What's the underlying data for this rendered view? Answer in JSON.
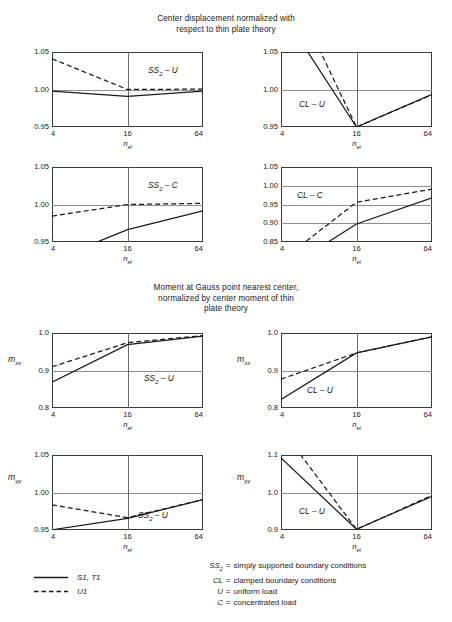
{
  "titles": {
    "displacement": "Center displacement normalized with\nrespect to thin plate theory",
    "moment": "Moment at Gauss point nearest center,\nnormalized by center moment of thin\nplate theory"
  },
  "axis": {
    "xlabel": "n",
    "xlabel_sub": "el",
    "xticks": [
      "4",
      "16",
      "64"
    ]
  },
  "legend": {
    "rows": [
      {
        "style": "solid",
        "label": "S1, T1"
      },
      {
        "style": "dashed",
        "label": "U1"
      }
    ],
    "definitions": [
      {
        "symbol": "SS",
        "symbol_sub": "2",
        "eq": "=",
        "text": "simply supported boundary conditions"
      },
      {
        "symbol": "CL",
        "symbol_sub": "",
        "eq": "=",
        "text": "clamped boundary conditions"
      },
      {
        "symbol": "U",
        "symbol_sub": "",
        "eq": "=",
        "text": "uniform load"
      },
      {
        "symbol": "C",
        "symbol_sub": "",
        "eq": "=",
        "text": "concentrated load"
      }
    ]
  },
  "chart_data": [
    {
      "id": "ss2-u-displacement",
      "type": "line",
      "title": "Center displacement normalized with respect to thin plate theory",
      "curve_label": "SS2 – U",
      "curve_label_main": "SS",
      "curve_label_sub": "2",
      "curve_label_tail": " – U",
      "xlabel": "n_el",
      "ylabel": "",
      "x": [
        4,
        16,
        64
      ],
      "xscale": "log2-categorical",
      "xticks": [
        "4",
        "16",
        "64"
      ],
      "yticks": [
        "1.05",
        "1.00",
        "0.95"
      ],
      "ytickvals": [
        1.05,
        1.0,
        0.95
      ],
      "ylim": [
        0.95,
        1.05
      ],
      "grid": true,
      "series": [
        {
          "name": "S1, T1",
          "style": "solid",
          "values": [
            0.998,
            0.991,
            0.998
          ]
        },
        {
          "name": "U1",
          "style": "dashed",
          "values": [
            1.041,
            1.0,
            1.0005
          ]
        }
      ]
    },
    {
      "id": "cl-u-displacement",
      "type": "line",
      "title": "Center displacement normalized with respect to thin plate theory",
      "curve_label": "CL – U",
      "curve_label_main": "CL",
      "curve_label_sub": "",
      "curve_label_tail": " – U",
      "xlabel": "n_el",
      "ylabel": "",
      "x": [
        4,
        16,
        64
      ],
      "xscale": "log2-categorical",
      "xticks": [
        "4",
        "16",
        "64"
      ],
      "yticks": [
        "1.05",
        "1.00",
        "0.95"
      ],
      "ytickvals": [
        1.05,
        1.0,
        0.95
      ],
      "ylim": [
        0.95,
        1.05
      ],
      "grid": true,
      "series": [
        {
          "name": "S1, T1",
          "style": "solid",
          "values": [
            1.105,
            0.95,
            0.9935
          ]
        },
        {
          "name": "U1",
          "style": "dashed",
          "values": [
            1.16,
            0.95,
            0.993
          ]
        }
      ]
    },
    {
      "id": "ss2-c-displacement",
      "type": "line",
      "title": "Center displacement normalized with respect to thin plate theory",
      "curve_label": "SS2 – C",
      "curve_label_main": "SS",
      "curve_label_sub": "2",
      "curve_label_tail": " – C",
      "xlabel": "n_el",
      "ylabel": "",
      "x": [
        4,
        16,
        64
      ],
      "xscale": "log2-categorical",
      "xticks": [
        "4",
        "16",
        "64"
      ],
      "yticks": [
        "1.05",
        "1.00",
        "0.95"
      ],
      "ytickvals": [
        1.05,
        1.0,
        0.95
      ],
      "ylim": [
        0.95,
        1.05
      ],
      "grid": true,
      "series": [
        {
          "name": "S1, T1",
          "style": "solid",
          "values": [
            0.9255,
            0.9665,
            0.9915
          ]
        },
        {
          "name": "U1",
          "style": "dashed",
          "values": [
            0.9845,
            1.0,
            1.0015
          ]
        }
      ]
    },
    {
      "id": "cl-c-displacement",
      "type": "line",
      "title": "Center displacement normalized with respect to thin plate theory",
      "curve_label": "CL – C",
      "curve_label_main": "CL",
      "curve_label_sub": "",
      "curve_label_tail": " – C",
      "xlabel": "n_el",
      "ylabel": "",
      "x": [
        4,
        16,
        64
      ],
      "xscale": "log2-categorical",
      "xticks": [
        "4",
        "16",
        "64"
      ],
      "yticks": [
        "1.05",
        "1.00",
        "0.95",
        "0.90",
        "0.85"
      ],
      "ytickvals": [
        1.05,
        1.0,
        0.95,
        0.9,
        0.85
      ],
      "ylim": [
        0.85,
        1.05
      ],
      "grid": true,
      "series": [
        {
          "name": "S1, T1",
          "style": "solid",
          "values": [
            0.77,
            0.898,
            0.968
          ]
        },
        {
          "name": "U1",
          "style": "dashed",
          "values": [
            0.8,
            0.956,
            0.991
          ]
        }
      ]
    },
    {
      "id": "ss2-u-mxx",
      "type": "line",
      "title": "Moment at Gauss point nearest center, normalized by center moment of thin plate theory",
      "curve_label": "SS2 – U",
      "curve_label_main": "SS",
      "curve_label_sub": "2",
      "curve_label_tail": " – U",
      "xlabel": "n_el",
      "ylabel": "m_xx",
      "ylabel_main": "m",
      "ylabel_sub": "xx",
      "x": [
        4,
        16,
        64
      ],
      "xscale": "log2-categorical",
      "xticks": [
        "4",
        "16",
        "64"
      ],
      "yticks": [
        "1.0",
        "0.9",
        "0.8"
      ],
      "ytickvals": [
        1.0,
        0.9,
        0.8
      ],
      "ylim": [
        0.8,
        1.0
      ],
      "grid": true,
      "series": [
        {
          "name": "S1, T1",
          "style": "solid",
          "values": [
            0.869,
            0.969,
            0.992
          ]
        },
        {
          "name": "U1",
          "style": "dashed",
          "values": [
            0.91,
            0.974,
            0.993
          ]
        }
      ]
    },
    {
      "id": "cl-u-mxx",
      "type": "line",
      "title": "Moment at Gauss point nearest center, normalized by center moment of thin plate theory",
      "curve_label": "CL – U",
      "curve_label_main": "CL",
      "curve_label_sub": "",
      "curve_label_tail": " – U",
      "xlabel": "n_el",
      "ylabel": "m_xx",
      "ylabel_main": "m",
      "ylabel_sub": "xx",
      "x": [
        4,
        16,
        64
      ],
      "xscale": "log2-categorical",
      "xticks": [
        "4",
        "16",
        "64"
      ],
      "yticks": [
        "1.0",
        "0.9",
        "0.8"
      ],
      "ytickvals": [
        1.0,
        0.9,
        0.8
      ],
      "ylim": [
        0.8,
        1.0
      ],
      "grid": true,
      "series": [
        {
          "name": "S1, T1",
          "style": "solid",
          "values": [
            0.823,
            0.947,
            0.99
          ]
        },
        {
          "name": "U1",
          "style": "dashed",
          "values": [
            0.877,
            0.947,
            0.99
          ]
        }
      ]
    },
    {
      "id": "ss2-u-myy",
      "type": "line",
      "title": "Moment at Gauss point nearest center, normalized by center moment of thin plate theory",
      "curve_label": "SS2 – U",
      "curve_label_main": "SS",
      "curve_label_sub": "2",
      "curve_label_tail": " – U",
      "xlabel": "n_el",
      "ylabel": "m_yy",
      "ylabel_main": "m",
      "ylabel_sub": "yy",
      "x": [
        4,
        16,
        64
      ],
      "xscale": "log2-categorical",
      "xticks": [
        "4",
        "16",
        "64"
      ],
      "yticks": [
        "1.05",
        "1.00",
        "0.95"
      ],
      "ytickvals": [
        1.05,
        1.0,
        0.95
      ],
      "ylim": [
        0.95,
        1.05
      ],
      "grid": true,
      "series": [
        {
          "name": "S1, T1",
          "style": "solid",
          "values": [
            0.9503,
            0.9655,
            0.9905
          ]
        },
        {
          "name": "U1",
          "style": "dashed",
          "values": [
            0.9835,
            0.9665,
            0.9905
          ]
        }
      ]
    },
    {
      "id": "cl-u-myy",
      "type": "line",
      "title": "Moment at Gauss point nearest center, normalized by center moment of thin plate theory",
      "curve_label": "CL – U",
      "curve_label_main": "CL",
      "curve_label_sub": "",
      "curve_label_tail": " – U",
      "xlabel": "n_el",
      "ylabel": "m_yy",
      "ylabel_main": "m",
      "ylabel_sub": "yy",
      "x": [
        4,
        16,
        64
      ],
      "xscale": "log2-categorical",
      "xticks": [
        "4",
        "16",
        "64"
      ],
      "yticks": [
        "1.1",
        "1.0",
        "0.9"
      ],
      "ytickvals": [
        1.1,
        1.0,
        0.9
      ],
      "ylim": [
        0.9,
        1.1
      ],
      "grid": true,
      "series": [
        {
          "name": "S1, T1",
          "style": "solid",
          "values": [
            1.092,
            0.902,
            0.99
          ]
        },
        {
          "name": "U1",
          "style": "dashed",
          "values": [
            1.17,
            0.902,
            0.992
          ]
        }
      ]
    }
  ],
  "layout": {
    "plots": [
      {
        "id": "ss2-u-displacement",
        "left": 52,
        "top": 52,
        "width": 151,
        "height": 75,
        "label_x": 96,
        "label_y": 14,
        "ylabel_x": -999,
        "ylabel_y": 0
      },
      {
        "id": "cl-u-displacement",
        "left": 281,
        "top": 52,
        "width": 151,
        "height": 75,
        "label_x": 18,
        "label_y": 48,
        "ylabel_x": -999,
        "ylabel_y": 0
      },
      {
        "id": "ss2-c-displacement",
        "left": 52,
        "top": 167,
        "width": 151,
        "height": 75,
        "label_x": 96,
        "label_y": 14,
        "ylabel_x": -999,
        "ylabel_y": 0
      },
      {
        "id": "cl-c-displacement",
        "left": 281,
        "top": 167,
        "width": 151,
        "height": 75,
        "label_x": 16,
        "label_y": 24,
        "ylabel_x": -999,
        "ylabel_y": 0
      },
      {
        "id": "ss2-u-mxx",
        "left": 52,
        "top": 333,
        "width": 151,
        "height": 75,
        "label_x": 92,
        "label_y": 41,
        "ylabel_x": -44,
        "ylabel_y": 22
      },
      {
        "id": "cl-u-mxx",
        "left": 281,
        "top": 333,
        "width": 151,
        "height": 75,
        "label_x": 26,
        "label_y": 53,
        "ylabel_x": -44,
        "ylabel_y": 22
      },
      {
        "id": "ss2-u-myy",
        "left": 52,
        "top": 455,
        "width": 151,
        "height": 75,
        "label_x": 86,
        "label_y": 56,
        "ylabel_x": -44,
        "ylabel_y": 18
      },
      {
        "id": "cl-u-myy",
        "left": 281,
        "top": 455,
        "width": 151,
        "height": 75,
        "label_x": 18,
        "label_y": 52,
        "ylabel_x": -44,
        "ylabel_y": 18
      }
    ]
  }
}
